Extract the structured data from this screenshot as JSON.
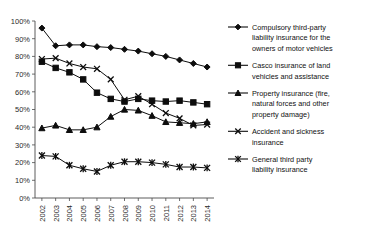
{
  "chart_data": {
    "type": "line",
    "title": "",
    "subtitle": "",
    "xlabel": "",
    "ylabel": "",
    "grid": false,
    "legend_position": "right",
    "categories": [
      "2002",
      "2003",
      "2004",
      "2005",
      "2006",
      "2007",
      "2008",
      "2009",
      "2010",
      "2011",
      "2012",
      "2013",
      "2014"
    ],
    "x": [
      2002,
      2003,
      2004,
      2005,
      2006,
      2007,
      2008,
      2009,
      2010,
      2011,
      2012,
      2013,
      2014
    ],
    "ylim": [
      0,
      100
    ],
    "ytick_labels": [
      "0%",
      "10%",
      "20%",
      "30%",
      "40%",
      "50%",
      "60%",
      "70%",
      "80%",
      "90%",
      "100%"
    ],
    "ytick_values": [
      0,
      10,
      20,
      30,
      40,
      50,
      60,
      70,
      80,
      90,
      100
    ],
    "xtick_labels": [
      "2002",
      "2003",
      "2004",
      "2005",
      "2006",
      "2007",
      "2008",
      "2009",
      "2010",
      "2011",
      "2012",
      "2013",
      "2014"
    ],
    "series": [
      {
        "name": "Compulsory third-party liability insurance for the owners of motor vehicles",
        "marker": "diamond",
        "values": [
          96,
          86,
          86.5,
          86.5,
          85.5,
          85,
          84,
          83,
          81.5,
          80,
          78,
          76,
          74
        ]
      },
      {
        "name": "Casco insurance of land vehicles and assistance",
        "marker": "square",
        "values": [
          77,
          73.5,
          71,
          67,
          59.5,
          56,
          54.5,
          56,
          55,
          54.5,
          55,
          54,
          53
        ]
      },
      {
        "name": "Property insurance (fire, natural forces and other property damage)",
        "marker": "triangle",
        "values": [
          39.5,
          41,
          38.5,
          38.5,
          40,
          46,
          50,
          49.5,
          46.5,
          43,
          42.5,
          42,
          43
        ]
      },
      {
        "name": "Accident and sickness insurance",
        "marker": "x",
        "values": [
          78.5,
          79,
          76,
          74,
          73,
          67,
          55.5,
          57.5,
          53,
          48,
          45,
          41,
          41.5
        ]
      },
      {
        "name": "General third party liability insurance",
        "marker": "asterisk",
        "values": [
          24,
          23.5,
          18.5,
          16.5,
          15,
          18.5,
          20.5,
          20.5,
          20,
          19,
          17.5,
          17.5,
          17
        ]
      }
    ]
  },
  "legend": {
    "items": [
      {
        "label": "Compulsory third-party liability insurance for the owners of motor vehicles",
        "marker": "diamond"
      },
      {
        "label": "Casco insurance of land vehicles and assistance",
        "marker": "square"
      },
      {
        "label": "Property insurance (fire, natural forces and other property damage)",
        "marker": "triangle"
      },
      {
        "label": "Accident and sickness insurance",
        "marker": "x"
      },
      {
        "label": "General third party liability insurance",
        "marker": "asterisk"
      }
    ],
    "lines": [
      [
        "Compulsory third-party",
        "liability insurance for the",
        "owners of motor vehicles"
      ],
      [
        "Casco insurance of land",
        "vehicles and assistance"
      ],
      [
        "Property insurance (fire,",
        "natural forces and other",
        "property damage)"
      ],
      [
        "Accident and sickness",
        "insurance"
      ],
      [
        "General third party",
        "liability insurance"
      ]
    ]
  },
  "colors": {
    "series": "#0d0d0d",
    "axis": "#4a4a4a",
    "text": "#1a1a1a",
    "background": "#ffffff"
  }
}
